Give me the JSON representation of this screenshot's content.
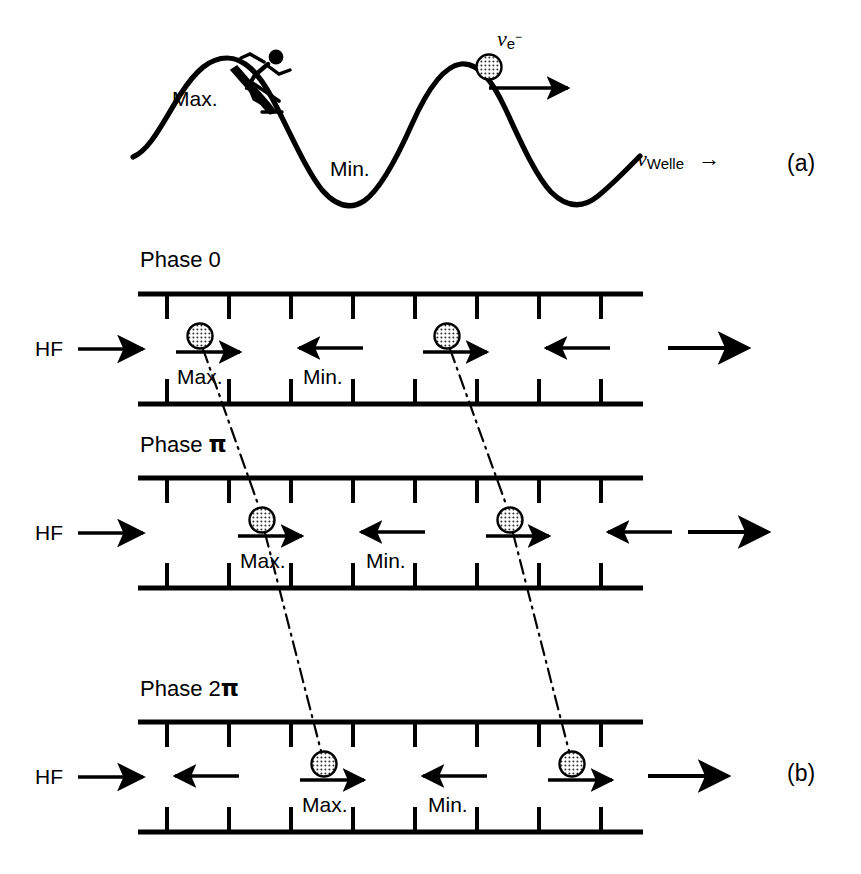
{
  "figure": {
    "background": "#ffffff",
    "ink": "#000000"
  },
  "panel_a": {
    "label": "(a)",
    "wave_labels": {
      "max": "Max.",
      "min": "Min."
    },
    "electron_velocity": {
      "symbol": "v",
      "subscript": "e",
      "superscript": "−"
    },
    "wave_velocity": {
      "symbol": "v",
      "subscript": "Welle"
    },
    "wave_velocity_arrow": "→",
    "icons": [
      "skier-icon",
      "electron-particle-icon",
      "electron-direction-arrow",
      "wave-curve"
    ]
  },
  "panel_b": {
    "label": "(b)",
    "hf_label": "HF",
    "rows": [
      {
        "phase_label": "Phase 0",
        "max_label": "Max.",
        "min_label": "Min.",
        "particles": [
          {
            "x": 200,
            "direction": "right"
          },
          {
            "x": 447,
            "direction": "right"
          }
        ],
        "field_arrows": [
          {
            "x": 205,
            "direction": "right",
            "with_particle": true
          },
          {
            "x": 330,
            "direction": "left",
            "with_particle": false
          },
          {
            "x": 452,
            "direction": "right",
            "with_particle": true
          }
        ],
        "extra_left_arrows": [],
        "exit_arrow": "right"
      },
      {
        "phase_label": "Phase π",
        "max_label": "Max.",
        "min_label": "Min.",
        "particles": [
          {
            "x": 262,
            "direction": "right"
          },
          {
            "x": 510,
            "direction": "right"
          }
        ],
        "field_arrows": [
          {
            "x": 267,
            "direction": "right",
            "with_particle": true
          },
          {
            "x": 392,
            "direction": "left",
            "with_particle": false
          },
          {
            "x": 514,
            "direction": "right",
            "with_particle": true
          },
          {
            "x": 622,
            "direction": "left",
            "with_particle": false
          }
        ],
        "extra_left_arrows": [],
        "exit_arrow": "right"
      },
      {
        "phase_label": "Phase 2π",
        "max_label": "Max.",
        "min_label": "Min.",
        "particles": [
          {
            "x": 324,
            "direction": "right"
          },
          {
            "x": 572,
            "direction": "right"
          }
        ],
        "field_arrows": [
          {
            "x": 205,
            "direction": "left",
            "with_particle": false
          },
          {
            "x": 329,
            "direction": "right",
            "with_particle": true
          },
          {
            "x": 452,
            "direction": "left",
            "with_particle": false
          },
          {
            "x": 576,
            "direction": "right",
            "with_particle": true
          }
        ],
        "extra_left_arrows": [],
        "exit_arrow": "right"
      }
    ],
    "tick_count_top": 8,
    "tick_count_bottom": 8,
    "connector_style": "dash-dot",
    "connectors": [
      {
        "from_row": 0,
        "from_x": 200,
        "to_row": 1,
        "to_x": 262
      },
      {
        "from_row": 0,
        "from_x": 447,
        "to_row": 1,
        "to_x": 510
      },
      {
        "from_row": 1,
        "from_x": 262,
        "to_row": 2,
        "to_x": 324
      },
      {
        "from_row": 1,
        "from_x": 510,
        "to_row": 2,
        "to_x": 572
      }
    ]
  }
}
